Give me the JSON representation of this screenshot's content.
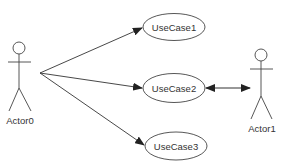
{
  "diagram": {
    "type": "uml-use-case",
    "actors": [
      {
        "id": "actor0",
        "label": "Actor0"
      },
      {
        "id": "actor1",
        "label": "Actor1"
      }
    ],
    "use_cases": [
      {
        "id": "uc1",
        "label": "UseCase1"
      },
      {
        "id": "uc2",
        "label": "UseCase2"
      },
      {
        "id": "uc3",
        "label": "UseCase3"
      }
    ],
    "relations": [
      {
        "from": "Actor0",
        "to": "UseCase1",
        "arrow": "directed"
      },
      {
        "from": "Actor0",
        "to": "UseCase2",
        "arrow": "directed"
      },
      {
        "from": "Actor0",
        "to": "UseCase3",
        "arrow": "directed"
      },
      {
        "from": "UseCase2",
        "to": "Actor1",
        "arrow": "bidirectional"
      }
    ],
    "colors": {
      "line": "#333333",
      "background": "#ffffff"
    }
  }
}
